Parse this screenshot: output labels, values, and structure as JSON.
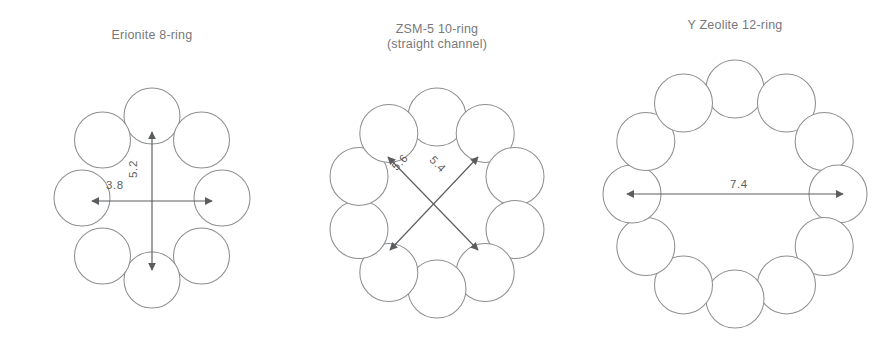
{
  "figure": {
    "background": "#ffffff",
    "stroke_color": "#8d8f91",
    "text_color": "#77797b",
    "arrow_color": "#5a5c5e",
    "units_note": "Angstrom"
  },
  "panels": [
    {
      "id": "erionite",
      "title": "Erionite 8-ring",
      "ring_size": 8,
      "center": {
        "x": 152,
        "y": 198
      },
      "circle_radius": 28,
      "ring_radius_x": 70,
      "ring_radius_y": 82,
      "circle_angles_deg": [
        90,
        45,
        0,
        -45,
        -90,
        -135,
        180,
        135
      ],
      "dimensions": [
        {
          "name": "vertical-aperture",
          "value": "5.2",
          "orientation": "vertical",
          "from": {
            "x": 152,
            "y": 270
          },
          "to": {
            "x": 152,
            "y": 132
          }
        },
        {
          "name": "horizontal-aperture",
          "value": "3.8",
          "orientation": "horizontal",
          "from": {
            "x": 92,
            "y": 201
          },
          "to": {
            "x": 212,
            "y": 201
          }
        }
      ]
    },
    {
      "id": "zsm5",
      "title": "ZSM-5 10-ring\n(straight channel)",
      "ring_size": 10,
      "center": {
        "x": 437,
        "y": 203
      },
      "circle_radius": 29,
      "ring_radius_x": 82,
      "ring_radius_y": 86,
      "circle_angles_deg": [
        90,
        54,
        18,
        -18,
        -54,
        -90,
        -126,
        -162,
        162,
        126
      ],
      "dimensions": [
        {
          "name": "diagonal-aperture-56",
          "value": "5.6",
          "orientation": "diagonal-left",
          "from": {
            "x": 478,
            "y": 250
          },
          "to": {
            "x": 388,
            "y": 157
          }
        },
        {
          "name": "diagonal-aperture-54",
          "value": "5.4",
          "orientation": "diagonal-right",
          "from": {
            "x": 390,
            "y": 250
          },
          "to": {
            "x": 478,
            "y": 157
          }
        }
      ]
    },
    {
      "id": "yzeolite",
      "title": "Y Zeolite 12-ring",
      "ring_size": 12,
      "center": {
        "x": 735,
        "y": 194
      },
      "circle_radius": 29,
      "ring_radius_x": 103,
      "ring_radius_y": 105,
      "circle_angles_deg": [
        90,
        60,
        30,
        0,
        -30,
        -60,
        -90,
        -120,
        -150,
        180,
        150,
        120
      ],
      "dimensions": [
        {
          "name": "horizontal-aperture",
          "value": "7.4",
          "orientation": "horizontal",
          "from": {
            "x": 627,
            "y": 194
          },
          "to": {
            "x": 843,
            "y": 194
          }
        }
      ]
    }
  ]
}
